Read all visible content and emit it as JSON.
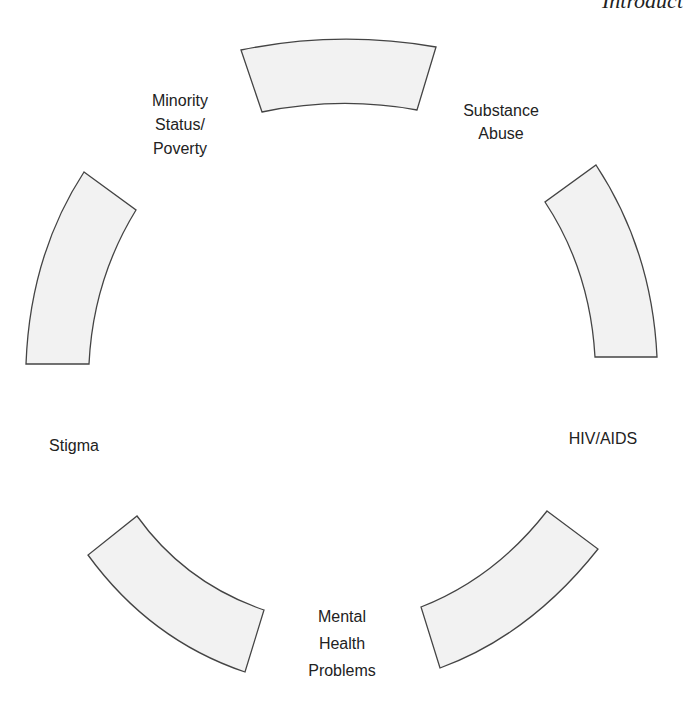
{
  "header": {
    "running_title": "Introduct"
  },
  "diagram": {
    "segment_fill": "#f2f2f2",
    "segment_stroke": "#444444",
    "labels": [
      {
        "id": "minority",
        "text": "Minority\nStatus/\nPoverty"
      },
      {
        "id": "substance",
        "text": "Substance\nAbuse"
      },
      {
        "id": "hiv",
        "text": "HIV/AIDS"
      },
      {
        "id": "mental",
        "text": "Mental\nHealth\nProblems"
      },
      {
        "id": "stigma",
        "text": "Stigma"
      }
    ]
  }
}
